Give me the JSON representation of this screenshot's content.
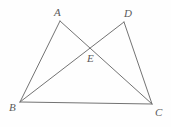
{
  "figure": {
    "name": "geometry-figure-two-triangles",
    "background_color": "#fefefe",
    "line_color": "#737373",
    "label_color": "#5a5a5a",
    "width": 171,
    "height": 127
  },
  "points": {
    "A": {
      "label": "A",
      "x": 60,
      "y": 21,
      "label_x": 54,
      "label_y": 7
    },
    "D": {
      "label": "D",
      "x": 124,
      "y": 22,
      "label_x": 124,
      "label_y": 8
    },
    "E": {
      "label": "E",
      "x": 93,
      "y": 46,
      "label_x": 87,
      "label_y": 53
    },
    "B": {
      "label": "B",
      "x": 20,
      "y": 102,
      "label_x": 9,
      "label_y": 102
    },
    "C": {
      "label": "C",
      "x": 152,
      "y": 104,
      "label_x": 155,
      "label_y": 107
    }
  },
  "segments": [
    {
      "name": "segment-BA",
      "x1": 20,
      "y1": 102,
      "x2": 60,
      "y2": 21
    },
    {
      "name": "segment-BD",
      "x1": 20,
      "y1": 102,
      "x2": 124,
      "y2": 22
    },
    {
      "name": "segment-AC",
      "x1": 60,
      "y1": 21,
      "x2": 152,
      "y2": 104
    },
    {
      "name": "segment-DC",
      "x1": 124,
      "y1": 22,
      "x2": 152,
      "y2": 104
    },
    {
      "name": "segment-BC",
      "x1": 20,
      "y1": 102,
      "x2": 152,
      "y2": 104
    }
  ]
}
